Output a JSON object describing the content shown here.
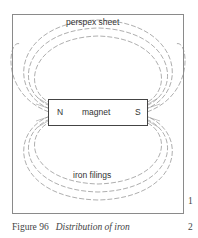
{
  "figure": {
    "top_label": "perspex sheet",
    "bottom_label": "iron filings",
    "magnet": {
      "north": "N",
      "label": "magnet",
      "south": "S"
    }
  },
  "caption": {
    "number": "Figure 96",
    "title": "Distribution of iron"
  },
  "line_numbers": [
    "1",
    "2"
  ]
}
